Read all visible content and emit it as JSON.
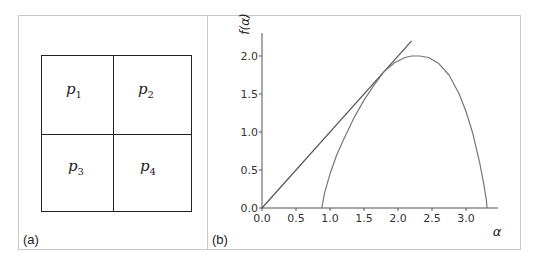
{
  "figure": {
    "panel_a": {
      "label": "(a)",
      "cells": [
        {
          "var": "p",
          "sub": "1"
        },
        {
          "var": "p",
          "sub": "2"
        },
        {
          "var": "p",
          "sub": "3"
        },
        {
          "var": "p",
          "sub": "4"
        }
      ]
    },
    "panel_b": {
      "label": "(b)"
    }
  },
  "chart_data": {
    "type": "line",
    "title": "",
    "xlabel": "α",
    "ylabel": "f(α)",
    "xlim": [
      0.0,
      3.5
    ],
    "ylim": [
      0.0,
      2.3
    ],
    "xticks": [
      "0.0",
      "0.5",
      "1.0",
      "1.5",
      "2.0",
      "2.5",
      "3.0"
    ],
    "yticks": [
      "0.0",
      "0.5",
      "1.0",
      "1.5",
      "2.0"
    ],
    "grid": false,
    "legend": null,
    "series": [
      {
        "name": "tangent line f = α",
        "x": [
          0.0,
          2.2
        ],
        "y": [
          0.0,
          2.2
        ]
      },
      {
        "name": "f(α) spectrum",
        "x": [
          0.88,
          0.92,
          1.0,
          1.1,
          1.2,
          1.35,
          1.5,
          1.65,
          1.8,
          1.95,
          2.1,
          2.2,
          2.32,
          2.45,
          2.6,
          2.75,
          2.9,
          3.0,
          3.1,
          3.2,
          3.26,
          3.3,
          3.31
        ],
        "y": [
          0.0,
          0.2,
          0.45,
          0.7,
          0.9,
          1.18,
          1.42,
          1.62,
          1.8,
          1.91,
          1.98,
          2.0,
          2.0,
          1.98,
          1.9,
          1.75,
          1.5,
          1.27,
          0.98,
          0.6,
          0.32,
          0.1,
          0.0
        ]
      }
    ]
  }
}
